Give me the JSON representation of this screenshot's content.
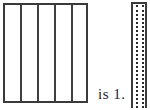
{
  "figure": {
    "caption_text": "is 1.",
    "background_color": "#ffffff",
    "stroke_color": "#3a3a3a",
    "divider_color": "#3f3f3f",
    "dotted_color": "#2b2b2b",
    "text_color": "#262626",
    "left_shape": {
      "name": "divided-rectangle",
      "strip_count": 5,
      "divider_count": 4,
      "divider_style": "solid",
      "fill": "none"
    },
    "right_shape": {
      "name": "narrow-column",
      "strip_count": 3,
      "divider_count": 2,
      "divider_style": "dotted",
      "fill": "none"
    }
  }
}
